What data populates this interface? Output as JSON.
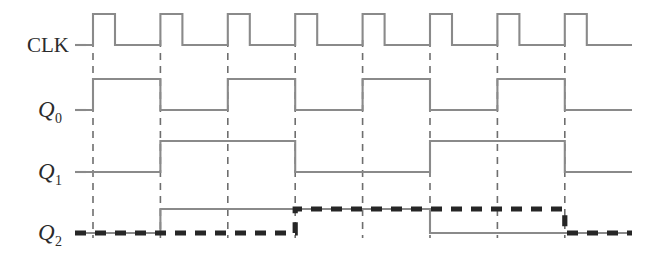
{
  "figure": {
    "type": "digital-timing-diagram",
    "width": 662,
    "height": 263,
    "background": "#ffffff"
  },
  "colors": {
    "trace": "#8a8a8a",
    "gridline": "#6e6e6e",
    "highlight": "#262626",
    "label": "#2b2b2b"
  },
  "labels": {
    "clk": "CLK",
    "q0_base": "Q",
    "q0_sub": "0",
    "q1_base": "Q",
    "q1_sub": "1",
    "q2_base": "Q",
    "q2_sub": "2"
  },
  "chart_data": {
    "type": "line",
    "title": "",
    "xlabel": "",
    "ylabel": "",
    "grid": true,
    "legend_position": "none",
    "x_axis": {
      "start_px": 75,
      "end_px": 632,
      "period_px": 67.4,
      "gridlines_px": [
        93,
        160.4,
        227.8,
        295.2,
        362.6,
        430.0,
        497.4,
        564.8
      ]
    },
    "rows": [
      {
        "name": "CLK",
        "label": "CLK",
        "low_y": 45,
        "high_y": 14,
        "style": "thin",
        "transitions_px": [
          [
            75,
            0
          ],
          [
            93,
            1
          ],
          [
            115,
            0
          ],
          [
            160.4,
            1
          ],
          [
            182.4,
            0
          ],
          [
            227.8,
            1
          ],
          [
            249.8,
            0
          ],
          [
            295.2,
            1
          ],
          [
            317.2,
            0
          ],
          [
            362.6,
            1
          ],
          [
            384.6,
            0
          ],
          [
            430.0,
            1
          ],
          [
            452.0,
            0
          ],
          [
            497.4,
            1
          ],
          [
            519.4,
            0
          ],
          [
            564.8,
            1
          ],
          [
            586.8,
            0
          ],
          [
            632,
            0
          ]
        ]
      },
      {
        "name": "Q0",
        "label": "Q0",
        "low_y": 110,
        "high_y": 79,
        "style": "thin",
        "transitions_px": [
          [
            75,
            0
          ],
          [
            93,
            1
          ],
          [
            160.4,
            0
          ],
          [
            227.8,
            1
          ],
          [
            295.2,
            0
          ],
          [
            362.6,
            1
          ],
          [
            430.0,
            0
          ],
          [
            497.4,
            1
          ],
          [
            564.8,
            0
          ],
          [
            632,
            0
          ]
        ]
      },
      {
        "name": "Q1",
        "label": "Q1",
        "low_y": 172,
        "high_y": 141,
        "style": "thin",
        "transitions_px": [
          [
            75,
            0
          ],
          [
            160.4,
            1
          ],
          [
            295.2,
            0
          ],
          [
            430.0,
            1
          ],
          [
            564.8,
            0
          ],
          [
            632,
            0
          ]
        ]
      },
      {
        "name": "Q2",
        "label": "Q2",
        "low_y": 233,
        "high_y": 209,
        "style": "thin",
        "transitions_px": [
          [
            75,
            0
          ],
          [
            160.4,
            1
          ],
          [
            430.0,
            0
          ],
          [
            632,
            0
          ]
        ]
      },
      {
        "name": "Q2-delayed",
        "label": "Q2 (highlighted)",
        "low_y": 233,
        "high_y": 209,
        "style": "thick-dashed",
        "transitions_px": [
          [
            75,
            0
          ],
          [
            295.2,
            1
          ],
          [
            564.8,
            0
          ],
          [
            632,
            0
          ]
        ]
      }
    ]
  }
}
